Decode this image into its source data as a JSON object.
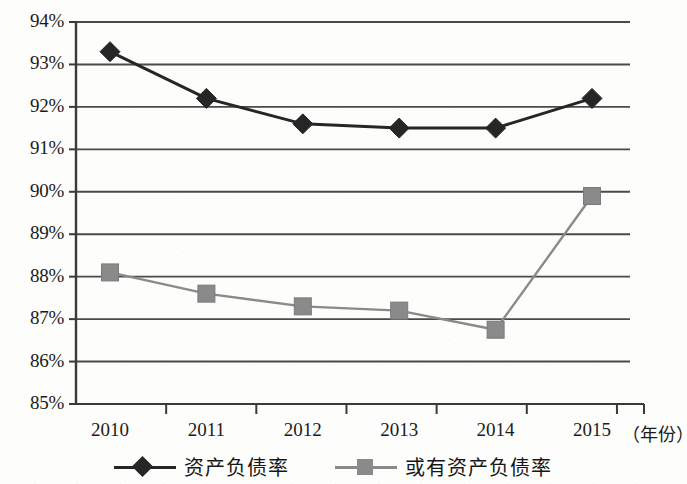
{
  "chart_data": {
    "type": "line",
    "title": "",
    "xlabel": "（年份）",
    "ylabel": "",
    "categories": [
      "2010",
      "2011",
      "2012",
      "2013",
      "2014",
      "2015"
    ],
    "ylim": [
      85,
      94
    ],
    "ytick_step": 1,
    "ytick_labels": [
      "94%",
      "93%",
      "92%",
      "91%",
      "90%",
      "89%",
      "88%",
      "87%",
      "86%",
      "85%"
    ],
    "ytick_values": [
      94,
      93,
      92,
      91,
      90,
      89,
      88,
      87,
      86,
      85
    ],
    "grid": true,
    "grid_axis": "y",
    "legend_position": "bottom",
    "series": [
      {
        "name": "资产负债率",
        "marker": "diamond",
        "color": "#262626",
        "values": [
          93.3,
          92.2,
          91.6,
          91.5,
          91.5,
          92.2
        ]
      },
      {
        "name": "或有资产负债率",
        "marker": "square",
        "color": "#8a8a8a",
        "values": [
          88.1,
          87.6,
          87.3,
          87.2,
          86.75,
          89.9
        ]
      }
    ]
  },
  "axis": {
    "x_title": "（年份）"
  },
  "legend": {
    "items": [
      {
        "label": "资产负债率",
        "marker": "diamond-marker",
        "color": "#262626"
      },
      {
        "label": "或有资产负债率",
        "marker": "square-marker",
        "color": "#8a8a8a"
      }
    ]
  },
  "colors": {
    "series_primary": "#262626",
    "series_secondary": "#8a8a8a",
    "axis": "#3a3a3a",
    "grid": "#4a4a4a",
    "background": "#fdfdfb",
    "text": "#1b1b1b"
  }
}
